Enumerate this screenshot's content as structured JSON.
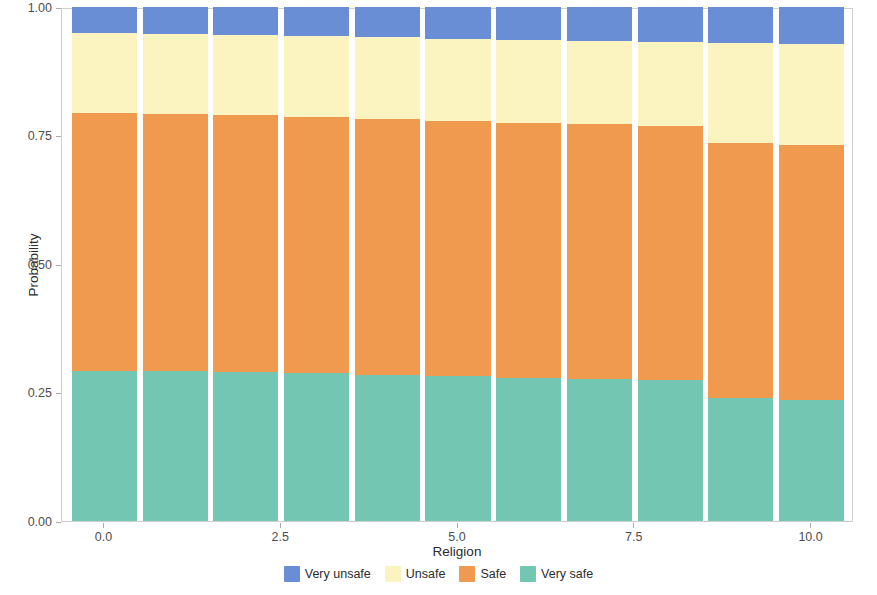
{
  "chart_data": {
    "type": "bar",
    "subtype": "stacked-bar-proportional",
    "title": "",
    "xlabel": "Religion",
    "ylabel": "Probability",
    "x": [
      0,
      1,
      2,
      3,
      4,
      5,
      6,
      7,
      8,
      9,
      10
    ],
    "categories": [
      "0",
      "1",
      "2",
      "3",
      "4",
      "5",
      "6",
      "7",
      "8",
      "9",
      "10"
    ],
    "xlim": [
      -0.6,
      10.6
    ],
    "ylim": [
      0.0,
      1.0
    ],
    "xticks": [
      0.0,
      2.5,
      5.0,
      7.5,
      10.0
    ],
    "xtick_labels": [
      "0.0",
      "2.5",
      "5.0",
      "7.5",
      "10.0"
    ],
    "yticks": [
      0.0,
      0.25,
      0.5,
      0.75,
      1.0
    ],
    "ytick_labels": [
      "0.00",
      "0.25",
      "0.50",
      "0.75",
      "1.00"
    ],
    "grid": false,
    "legend_position": "bottom",
    "stack_order_bottom_to_top": [
      "Very safe",
      "Safe",
      "Unsafe",
      "Very unsafe"
    ],
    "series": [
      {
        "name": "Very unsafe",
        "color": "#6a8ed6",
        "values": [
          0.051,
          0.053,
          0.055,
          0.057,
          0.059,
          0.062,
          0.064,
          0.066,
          0.068,
          0.07,
          0.072
        ]
      },
      {
        "name": "Unsafe",
        "color": "#fbf3c0",
        "values": [
          0.155,
          0.155,
          0.156,
          0.157,
          0.158,
          0.159,
          0.161,
          0.162,
          0.163,
          0.194,
          0.196
        ]
      },
      {
        "name": "Safe",
        "color": "#ef9a4f",
        "values": [
          0.502,
          0.501,
          0.5,
          0.499,
          0.498,
          0.497,
          0.496,
          0.495,
          0.494,
          0.496,
          0.497
        ]
      },
      {
        "name": "Very safe",
        "color": "#72c6b2",
        "values": [
          0.292,
          0.291,
          0.289,
          0.287,
          0.285,
          0.282,
          0.279,
          0.277,
          0.275,
          0.24,
          0.235
        ]
      }
    ]
  },
  "legend": {
    "entries": [
      {
        "label": "Very unsafe",
        "color": "#6a8ed6"
      },
      {
        "label": "Unsafe",
        "color": "#fbf3c0"
      },
      {
        "label": "Safe",
        "color": "#ef9a4f"
      },
      {
        "label": "Very safe",
        "color": "#72c6b2"
      }
    ]
  },
  "axes": {
    "x_title": "Religion",
    "y_title": "Probability"
  }
}
